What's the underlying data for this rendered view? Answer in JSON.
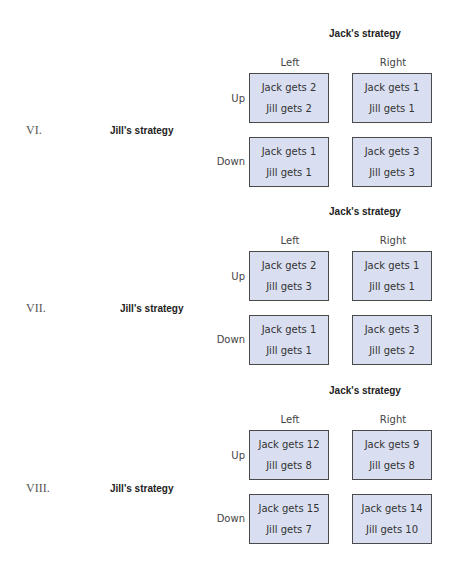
{
  "games": [
    {
      "number": "VI.",
      "row_player_label": "Jill's strategy",
      "col_player_label": "Jack's strategy",
      "columns": [
        "Left",
        "Right"
      ],
      "rows": [
        "Up",
        "Down"
      ],
      "cells": [
        [
          {
            "jack": "Jack gets 2",
            "jill": "Jill gets 2"
          },
          {
            "jack": "Jack gets 1",
            "jill": "Jill gets 1"
          }
        ],
        [
          {
            "jack": "Jack gets 1",
            "jill": "Jill gets 1"
          },
          {
            "jack": "Jack gets 3",
            "jill": "Jill gets 3"
          }
        ]
      ]
    },
    {
      "number": "VII.",
      "row_player_label": "Jill's strategy",
      "col_player_label": "Jack's strategy",
      "columns": [
        "Left",
        "Right"
      ],
      "rows": [
        "Up",
        "Down"
      ],
      "cells": [
        [
          {
            "jack": "Jack gets 2",
            "jill": "Jill gets 3"
          },
          {
            "jack": "Jack gets 1",
            "jill": "Jill gets 1"
          }
        ],
        [
          {
            "jack": "Jack gets 1",
            "jill": "Jill gets 1"
          },
          {
            "jack": "Jack gets 3",
            "jill": "Jill gets 2"
          }
        ]
      ]
    },
    {
      "number": "VIII.",
      "row_player_label": "Jill's strategy",
      "col_player_label": "Jack's strategy",
      "columns": [
        "Left",
        "Right"
      ],
      "rows": [
        "Up",
        "Down"
      ],
      "cells": [
        [
          {
            "jack": "Jack gets 12",
            "jill": "Jill gets 8"
          },
          {
            "jack": "Jack gets 9",
            "jill": "Jill gets 8"
          }
        ],
        [
          {
            "jack": "Jack gets 15",
            "jill": "Jill gets 7"
          },
          {
            "jack": "Jack gets 14",
            "jill": "Jill gets 10"
          }
        ]
      ]
    }
  ],
  "colors": {
    "cell_fill": "#d9dff0",
    "cell_border": "#4a4a4a"
  }
}
